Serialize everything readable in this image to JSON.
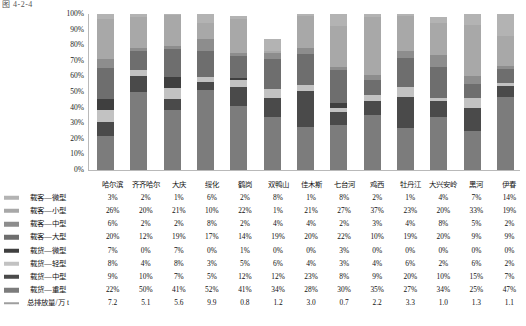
{
  "figure": {
    "caption": "图 4-2-4"
  },
  "chart_data": {
    "type": "bar",
    "stacked": true,
    "normalized": "100%",
    "title": "",
    "xlabel": "",
    "ylabel": "",
    "ylim": [
      0,
      100
    ],
    "ytick_labels": [
      "100%",
      "90%",
      "80%",
      "70%",
      "60%",
      "50%",
      "40%",
      "30%",
      "20%",
      "10%",
      "0%"
    ],
    "grid": false,
    "legend_position": "left-table",
    "categories": [
      "哈尔滨",
      "齐齐哈尔",
      "大庆",
      "绥化",
      "鹤岗",
      "双鸭山",
      "佳木斯",
      "七台河",
      "鸡西",
      "牡丹江",
      "大兴安岭",
      "黑河",
      "伊春"
    ],
    "series": [
      {
        "name": "载客—微型",
        "color": "#b3b3b3",
        "unit": "%",
        "values": [
          3,
          2,
          1,
          6,
          2,
          8,
          1,
          8,
          2,
          1,
          4,
          7,
          14
        ],
        "labels": [
          "3%",
          "2%",
          "1%",
          "6%",
          "2%",
          "8%",
          "1%",
          "8%",
          "2%",
          "1%",
          "4%",
          "7%",
          "14%"
        ]
      },
      {
        "name": "载客—小型",
        "color": "#a8a8a8",
        "unit": "%",
        "values": [
          26,
          20,
          21,
          10,
          22,
          1,
          21,
          27,
          37,
          23,
          20,
          33,
          19
        ],
        "labels": [
          "26%",
          "20%",
          "21%",
          "10%",
          "22%",
          "1%",
          "21%",
          "27%",
          "37%",
          "23%",
          "20%",
          "33%",
          "19%"
        ]
      },
      {
        "name": "载客—中型",
        "color": "#8d8d8d",
        "unit": "%",
        "values": [
          6,
          2,
          2,
          8,
          2,
          4,
          4,
          2,
          3,
          4,
          8,
          5,
          2
        ],
        "labels": [
          "6%",
          "2%",
          "2%",
          "8%",
          "2%",
          "4%",
          "4%",
          "2%",
          "3%",
          "4%",
          "8%",
          "5%",
          "2%"
        ]
      },
      {
        "name": "载客—大型",
        "color": "#6e6e6e",
        "unit": "%",
        "values": [
          20,
          12,
          19,
          17,
          14,
          19,
          20,
          22,
          10,
          19,
          20,
          9,
          9
        ],
        "labels": [
          "20%",
          "12%",
          "19%",
          "17%",
          "14%",
          "19%",
          "20%",
          "22%",
          "10%",
          "19%",
          "20%",
          "9%",
          "9%"
        ]
      },
      {
        "name": "载货—微型",
        "color": "#3f3f3f",
        "unit": "%",
        "values": [
          7,
          0,
          7,
          0,
          1,
          0,
          0,
          3,
          0,
          0,
          0,
          0,
          0
        ],
        "labels": [
          "7%",
          "0%",
          "7%",
          "0%",
          "1%",
          "0%",
          "0%",
          "3%",
          "0%",
          "0%",
          "0%",
          "0%",
          "0%"
        ]
      },
      {
        "name": "载货—轻型",
        "color": "#c2c2c2",
        "unit": "%",
        "values": [
          8,
          4,
          8,
          3,
          5,
          6,
          4,
          3,
          4,
          6,
          2,
          6,
          2
        ],
        "labels": [
          "8%",
          "4%",
          "8%",
          "3%",
          "5%",
          "6%",
          "4%",
          "3%",
          "4%",
          "6%",
          "2%",
          "6%",
          "2%"
        ]
      },
      {
        "name": "载货—中型",
        "color": "#4a4a4a",
        "unit": "%",
        "values": [
          9,
          10,
          7,
          5,
          12,
          12,
          23,
          8,
          9,
          20,
          10,
          15,
          7
        ],
        "labels": [
          "9%",
          "10%",
          "7%",
          "5%",
          "12%",
          "12%",
          "23%",
          "8%",
          "9%",
          "20%",
          "10%",
          "15%",
          "7%"
        ]
      },
      {
        "name": "载货—重型",
        "color": "#7c7c7c",
        "unit": "%",
        "values": [
          22,
          50,
          41,
          52,
          41,
          34,
          28,
          30,
          35,
          27,
          34,
          25,
          47
        ],
        "labels": [
          "22%",
          "50%",
          "41%",
          "52%",
          "41%",
          "34%",
          "28%",
          "30%",
          "35%",
          "27%",
          "34%",
          "25%",
          "47%"
        ]
      }
    ],
    "secondary_series": {
      "name": "总排放量/万 t",
      "color": "#9e9e9e",
      "unit": "万 t",
      "values": [
        7.2,
        5.1,
        5.6,
        9.9,
        0.8,
        1.2,
        3.0,
        0.7,
        2.2,
        3.3,
        1.0,
        1.3,
        1.1
      ],
      "labels": [
        "7.2",
        "5.1",
        "5.6",
        "9.9",
        "0.8",
        "1.2",
        "3.0",
        "0.7",
        "2.2",
        "3.3",
        "1.0",
        "1.3",
        "1.1"
      ]
    }
  }
}
